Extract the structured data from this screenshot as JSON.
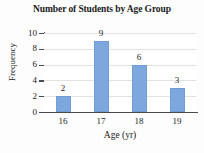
{
  "chart_data": {
    "type": "bar",
    "title": "Number of Students by Age Group",
    "xlabel": "Age (yr)",
    "ylabel": "Frequency",
    "categories": [
      "16",
      "17",
      "18",
      "19"
    ],
    "values": [
      2,
      9,
      6,
      3
    ],
    "value_labels": [
      "2",
      "9",
      "6",
      "3"
    ],
    "ylim": [
      0,
      10
    ],
    "y_ticks": [
      10,
      8,
      6,
      4,
      2,
      0
    ],
    "y_tick_labels": [
      "10",
      "8",
      "6",
      "4",
      "2",
      "0"
    ],
    "grid": "horizontal",
    "legend": "none",
    "bar_color": "#7ea8dd",
    "axis_color": "#4a4a4a",
    "grid_color": "#e2e2e2",
    "text_color": "#1b1b1b",
    "background_color": "#fdfdfd"
  }
}
